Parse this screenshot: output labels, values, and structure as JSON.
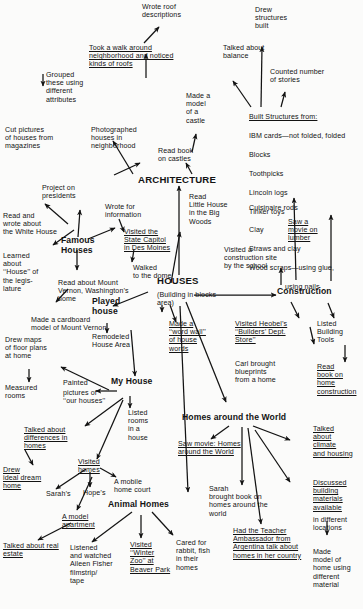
{
  "document": {
    "type": "concept-map",
    "title": "Houses Concept Map",
    "ink_color": "#131313",
    "paper_color": "#fbfbfa"
  },
  "hubs": {
    "architecture": "ARCHITECTURE",
    "houses": "HOUSES",
    "construction": "Construction",
    "famous_houses": "Famous\nHouses",
    "played_house": "Played\nhouse",
    "my_house": "My House",
    "animal_homes": "Animal Homes",
    "homes_around_world": "Homes around the World"
  },
  "nodes": {
    "wrote_roof_descriptions": "Wrote roof\ndescriptions",
    "took_a_walk": "Took a walk around\nneighborhood and noticed\nkinds of roofs",
    "grouped_these": "Grouped\nthese using\ndifferent\nattributes",
    "cut_pictures": "Cut pictures\nof houses from\nmagazines",
    "photographed_houses": "Photographed\nhouses in\nneighborhood",
    "made_a_model_castle": "Made a\nmodel\nof a\ncastle",
    "read_book_on_castles": "Read book\non castles",
    "talked_about_balance": "Talked about\nbalance",
    "drew_structures_built": "Drew\nstructures\nbuilt",
    "counted_number_of_stories": "Counted number\nof stories",
    "built_structures_heading": "Built Structures from:",
    "built_structures_items": [
      "IBM cards—not folded, folded",
      "Blocks",
      "Toothpicks",
      "Lincoln logs",
      "Tinker toys",
      "Clay",
      "Straws and clay",
      "Wood scraps—using glue,",
      "using nails"
    ],
    "cuisinaire_rods": "Cuisinaire rods",
    "saw_a_movie_on_lumber": "Saw a\nmovie on\nlumber",
    "project_on_presidents": "Project on\npresidents",
    "read_and_wrote_white_house": "Read and\nwrote about\nthe White House",
    "learned_about_house_legislature": "Learned\nabout\n‘‘House’’ of\nthe legis-\nlature",
    "read_about_mount_vernon": "Read about Mount\nVernon, Washington’s\nhome",
    "made_cardboard_model": "Made a cardboard\nmodel of Mount Vernon",
    "wrote_for_information": "Wrote for\ninformation",
    "visited_state_capitol": "Visited the\nState Capitol\nin Des Moines",
    "walked_to_the_dome": "Walked\nto the dome",
    "read_little_house": "Read\nLittle House\nin the Big\nWoods",
    "visited_construction_site": "Visited a\nconstruction site\nby the school",
    "building_in_blocks_area": "(Building in blocks\narea)",
    "made_word_wall": "Made a\n‘‘word wall’’\nof house\nwords",
    "remodeled_house_area": "Remodeled\nHouse Area",
    "visited_heobels": "Visited Heobel’s\n‘‘Builders’ Dept.\nStore’’",
    "carl_brought_blueprints": "Carl brought\nblueprints\nfrom a home",
    "listed_building_tools": "Listed\nBuilding\nTools",
    "read_book_on_home_construction": "Read\nbook on\nhome\nconstruction",
    "talked_about_climate": "Talked\nabout\nclimate\nand housing",
    "discussed_building_materials": "Discussed\nbuilding\nmaterials\navailable",
    "in_different_locations": "in different\nlocations",
    "made_model_of_home": "Made\nmodel of\nhome using\ndifferent\nmaterial",
    "drew_maps_floor_plans": "Drew maps\nof floor plans\nat home",
    "measured_rooms": "Measured\nrooms",
    "painted_pictures": "Painted",
    "pictures_of_our_houses": "pictures of\n‘‘our houses’’",
    "listed_rooms_in_a_house": "Listed\nrooms\nin a\nhouse",
    "talked_about_differences": "Talked about\ndifferences in\nhomes",
    "drew_ideal_dream_home": "Drew\nideal dream\nhome",
    "visited_homes": "Visited\nhomes",
    "sarahs": "Sarah’s",
    "hopes": "Hope’s",
    "a_mobile_home_court": "A mobile\nhome court",
    "a_model_apartment": "A model\napartment",
    "talked_about_real_estate": "Talked about real\nestate",
    "listened_aileen_fisher": "Listened\nand watched\nAileen Fisher\nfilmstrip/\ntape",
    "visited_winter_zoo": "Visited\n‘‘Winter\nZoo’’ at\nBeaver Park",
    "cared_for_rabbit": "Cared for\nrabbit, fish\nin their\nhomes",
    "saw_movie_homes_around_world": "Saw movie: Homes\naround the World",
    "sarah_brought_book": "Sarah\nbrought book on\nhomes around the\nworld",
    "had_teacher_ambassador": "Had the Teacher\nAmbassador from\nArgentina talk about\nhomes in her country"
  },
  "edges": [
    {
      "from": "took_a_walk",
      "to": "wrote_roof_descriptions"
    },
    {
      "from": "took_a_walk",
      "to": "architecture"
    },
    {
      "from": "architecture",
      "to": "cut_pictures"
    },
    {
      "from": "photographed_houses",
      "to": "architecture"
    },
    {
      "from": "read_book_on_castles",
      "to": "made_a_model_castle"
    },
    {
      "from": "read_book_on_castles",
      "to": "architecture"
    },
    {
      "from": "grouped_these",
      "to": "cut_pictures"
    },
    {
      "from": "built_structures_heading",
      "to": "talked_about_balance"
    },
    {
      "from": "built_structures_heading",
      "to": "drew_structures_built"
    },
    {
      "from": "built_structures_heading",
      "to": "counted_number_of_stories"
    },
    {
      "from": "houses",
      "to": "architecture"
    },
    {
      "from": "houses",
      "to": "construction"
    },
    {
      "from": "houses",
      "to": "famous_houses"
    },
    {
      "from": "houses",
      "to": "played_house"
    },
    {
      "from": "houses",
      "to": "read_little_house"
    },
    {
      "from": "houses",
      "to": "made_word_wall"
    },
    {
      "from": "houses",
      "to": "animal_homes"
    },
    {
      "from": "houses",
      "to": "homes_around_world"
    },
    {
      "from": "famous_houses",
      "to": "project_on_presidents"
    },
    {
      "from": "project_on_presidents",
      "to": "read_and_wrote_white_house"
    },
    {
      "from": "famous_houses",
      "to": "learned_about_house_legislature"
    },
    {
      "from": "famous_houses",
      "to": "read_about_mount_vernon"
    },
    {
      "from": "read_about_mount_vernon",
      "to": "made_cardboard_model"
    },
    {
      "from": "famous_houses",
      "to": "visited_state_capitol"
    },
    {
      "from": "wrote_for_information",
      "to": "visited_state_capitol"
    },
    {
      "from": "visited_state_capitol",
      "to": "walked_to_the_dome"
    },
    {
      "from": "played_house",
      "to": "remodeled_house_area"
    },
    {
      "from": "played_house",
      "to": "my_house"
    },
    {
      "from": "my_house",
      "to": "drew_maps_floor_plans"
    },
    {
      "from": "drew_maps_floor_plans",
      "to": "measured_rooms"
    },
    {
      "from": "my_house",
      "to": "painted_pictures"
    },
    {
      "from": "my_house",
      "to": "listed_rooms_in_a_house"
    },
    {
      "from": "my_house",
      "to": "talked_about_differences"
    },
    {
      "from": "talked_about_differences",
      "to": "drew_ideal_dream_home"
    },
    {
      "from": "my_house",
      "to": "visited_homes"
    },
    {
      "from": "visited_homes",
      "to": "sarahs"
    },
    {
      "from": "visited_homes",
      "to": "hopes"
    },
    {
      "from": "visited_homes",
      "to": "a_mobile_home_court"
    },
    {
      "from": "visited_homes",
      "to": "a_model_apartment"
    },
    {
      "from": "a_model_apartment",
      "to": "talked_about_real_estate"
    },
    {
      "from": "animal_homes",
      "to": "listened_aileen_fisher"
    },
    {
      "from": "animal_homes",
      "to": "visited_winter_zoo"
    },
    {
      "from": "animal_homes",
      "to": "cared_for_rabbit"
    },
    {
      "from": "construction",
      "to": "visited_construction_site"
    },
    {
      "from": "construction",
      "to": "visited_heobels"
    },
    {
      "from": "visited_heobels",
      "to": "carl_brought_blueprints"
    },
    {
      "from": "construction",
      "to": "listed_building_tools"
    },
    {
      "from": "listed_building_tools",
      "to": "read_book_on_home_construction"
    },
    {
      "from": "construction",
      "to": "cuisinaire_rods"
    },
    {
      "from": "construction",
      "to": "saw_a_movie_on_lumber"
    },
    {
      "from": "homes_around_world",
      "to": "saw_movie_homes_around_world"
    },
    {
      "from": "homes_around_world",
      "to": "sarah_brought_book"
    },
    {
      "from": "homes_around_world",
      "to": "had_teacher_ambassador"
    },
    {
      "from": "homes_around_world",
      "to": "talked_about_climate"
    },
    {
      "from": "homes_around_world",
      "to": "discussed_building_materials"
    },
    {
      "from": "discussed_building_materials",
      "to": "made_model_of_home"
    }
  ]
}
